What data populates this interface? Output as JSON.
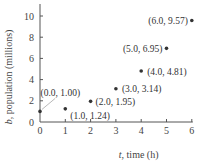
{
  "chart_data": {
    "type": "scatter",
    "title": "",
    "xlabel": "t, time (h)",
    "ylabel": "b, population (millions)",
    "xlim": [
      0,
      6
    ],
    "ylim": [
      0,
      10
    ],
    "x_ticks": [
      "0",
      "1",
      "2",
      "3",
      "4",
      "5",
      "6"
    ],
    "y_ticks": [
      "0",
      "2",
      "4",
      "6",
      "8",
      "10"
    ],
    "grid": false,
    "series": [
      {
        "name": "population",
        "x": [
          0.0,
          1.0,
          2.0,
          3.0,
          4.0,
          5.0,
          6.0
        ],
        "y": [
          1.0,
          1.24,
          1.95,
          3.14,
          4.81,
          6.95,
          9.57
        ]
      }
    ],
    "annotations": [
      "(0.0, 1.00)",
      "(1.0, 1.24)",
      "(2.0, 1.95)",
      "(3.0, 3.14)",
      "(4.0, 4.81)",
      "(5.0, 6.95)",
      "(6.0, 9.57)"
    ]
  },
  "labels": {
    "xlabel_var": "t",
    "xlabel_rest": ", time (h)",
    "ylabel_var": "b",
    "ylabel_rest": ", population (millions)"
  }
}
